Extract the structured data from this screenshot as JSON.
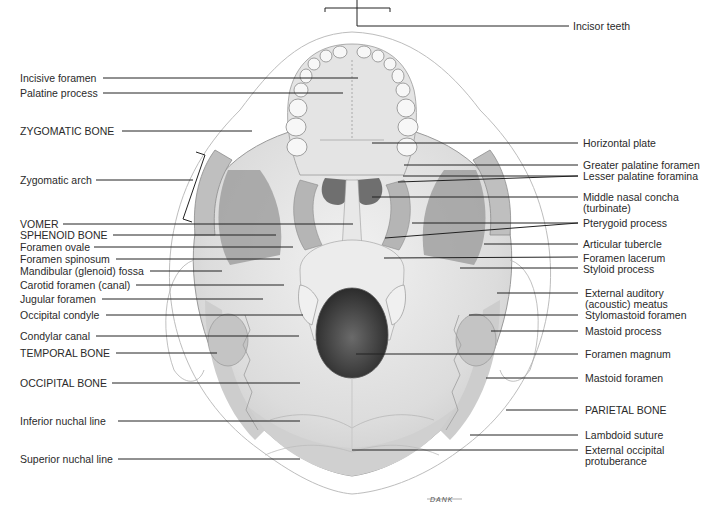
{
  "figure": {
    "signature": "DANK"
  },
  "labels_left": [
    {
      "text": "Incisive foramen",
      "y": 78
    },
    {
      "text": "Palatine process",
      "y": 93
    },
    {
      "text": "ZYGOMATIC BONE",
      "y": 131
    },
    {
      "text": "Zygomatic arch",
      "y": 180
    },
    {
      "text": "VOMER",
      "y": 224
    },
    {
      "text": "SPHENOID BONE",
      "y": 235
    },
    {
      "text": "Foramen ovale",
      "y": 247
    },
    {
      "text": "Foramen spinosum",
      "y": 259
    },
    {
      "text": "Mandibular (glenoid) fossa",
      "y": 271
    },
    {
      "text": "Carotid foramen (canal)",
      "y": 285
    },
    {
      "text": "Jugular foramen",
      "y": 299
    },
    {
      "text": "Occipital condyle",
      "y": 315
    },
    {
      "text": "Condylar canal",
      "y": 336
    },
    {
      "text": "TEMPORAL BONE",
      "y": 353
    },
    {
      "text": "OCCIPITAL BONE",
      "y": 383
    },
    {
      "text": "Inferior nuchal line",
      "y": 421
    },
    {
      "text": "Superior nuchal line",
      "y": 459
    }
  ],
  "labels_right": [
    {
      "text": "Incisor teeth",
      "y": 25
    },
    {
      "text": "Horizontal plate",
      "y": 142
    },
    {
      "text": "Greater palatine foramen",
      "y": 164
    },
    {
      "text": "Lesser palatine foramina",
      "y": 175
    },
    {
      "text": "Middle nasal concha",
      "y": 196
    },
    {
      "text": "(turbinate)",
      "y": 207
    },
    {
      "text": "Pterygoid process",
      "y": 222
    },
    {
      "text": "Articular tubercle",
      "y": 243
    },
    {
      "text": "Foramen lacerum",
      "y": 257
    },
    {
      "text": "Styloid process",
      "y": 268
    },
    {
      "text": "External auditory",
      "y": 292
    },
    {
      "text": "(acoustic) meatus",
      "y": 303
    },
    {
      "text": "Stylomastoid foramen",
      "y": 315
    },
    {
      "text": "Mastoid process",
      "y": 331
    },
    {
      "text": "Foramen magnum",
      "y": 353
    },
    {
      "text": "Mastoid foramen",
      "y": 377
    },
    {
      "text": "PARIETAL BONE",
      "y": 409
    },
    {
      "text": "Lambdoid suture",
      "y": 434
    },
    {
      "text": "External occipital",
      "y": 449
    },
    {
      "text": "protuberance",
      "y": 460
    }
  ]
}
